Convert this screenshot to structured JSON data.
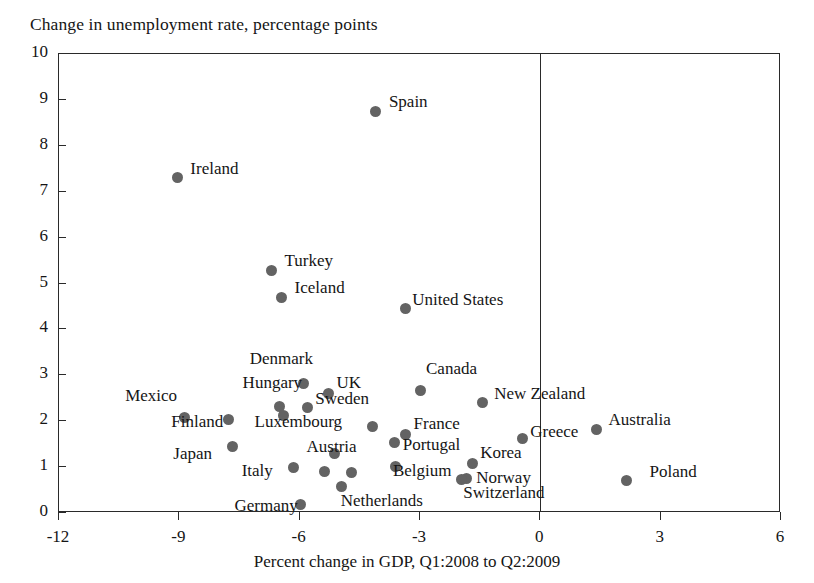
{
  "chart_data": {
    "type": "scatter",
    "title": "Change in unemployment rate, percentage points",
    "xlabel": "Percent change in GDP, Q1:2008 to Q2:2009",
    "ylabel": "Change in unemployment rate, percentage points",
    "xlim": [
      -12,
      6
    ],
    "ylim": [
      0,
      10
    ],
    "xticks": [
      -12,
      -9,
      -6,
      -3,
      0,
      3,
      6
    ],
    "yticks": [
      0,
      1,
      2,
      3,
      4,
      5,
      6,
      7,
      8,
      9,
      10
    ],
    "grid": false,
    "legend": "none",
    "marker_color": "#636363",
    "axis_color": "#2a2a2a",
    "annotations": [
      "Vertical reference line drawn at x = 0"
    ],
    "points": [
      {
        "label": "Spain",
        "x": -4.1,
        "y": 8.75,
        "lx": 14,
        "ly": -9
      },
      {
        "label": "Ireland",
        "x": -9.05,
        "y": 7.3,
        "lx": 14,
        "ly": -9
      },
      {
        "label": "Turkey",
        "x": -6.7,
        "y": 5.29,
        "lx": 14,
        "ly": -9
      },
      {
        "label": "Iceland",
        "x": -6.45,
        "y": 4.7,
        "lx": 14,
        "ly": -9
      },
      {
        "label": "United States",
        "x": -3.37,
        "y": 4.45,
        "lx": 8,
        "ly": -9
      },
      {
        "label": "Denmark",
        "x": -5.9,
        "y": 2.83,
        "lx": -53,
        "ly": -24
      },
      {
        "label": "UK",
        "x": -5.28,
        "y": 2.61,
        "lx": 9,
        "ly": -10
      },
      {
        "label": "Canada",
        "x": -3.0,
        "y": 2.66,
        "lx": 7,
        "ly": -22
      },
      {
        "label": "Sweden",
        "x": -5.81,
        "y": 2.29,
        "lx": 9,
        "ly": -9
      },
      {
        "label": "New Zealand",
        "x": -1.45,
        "y": 2.4,
        "lx": 13,
        "ly": -9
      },
      {
        "label": "Hungary",
        "x": -6.5,
        "y": 2.33,
        "lx": -36,
        "ly": -23
      },
      {
        "label": "Mexico",
        "x": -8.88,
        "y": 2.07,
        "lx": -58,
        "ly": -22
      },
      {
        "label": "Luxembourg",
        "x": -6.4,
        "y": 2.12,
        "lx": -28,
        "ly": 6
      },
      {
        "label": "Australia",
        "x": 1.4,
        "y": 1.82,
        "lx": 13,
        "ly": -9
      },
      {
        "label": "Finland",
        "x": -7.78,
        "y": 2.04,
        "lx": -56,
        "ly": 3
      },
      {
        "label": "Poland ",
        "x": -4.18,
        "y": 1.89,
        "lx": 0,
        "ly": 0,
        "hide_label": true
      },
      {
        "label": "France",
        "x": -3.36,
        "y": 1.72,
        "lx": 9,
        "ly": -10
      },
      {
        "label": "Portugal",
        "x": -3.63,
        "y": 1.54,
        "lx": 9,
        "ly": 3
      },
      {
        "label": "Greece",
        "x": -0.45,
        "y": 1.63,
        "lx": 9,
        "ly": -6
      },
      {
        "label": "Japan",
        "x": -7.68,
        "y": 1.44,
        "lx": -58,
        "ly": 7
      },
      {
        "label": "Korea",
        "x": -1.7,
        "y": 1.08,
        "lx": 9,
        "ly": -10
      },
      {
        "label": "Austria",
        "x": -5.38,
        "y": 0.9,
        "lx": -17,
        "ly": -25
      },
      {
        "label": "Italy",
        "x": -6.15,
        "y": 0.99,
        "lx": -51,
        "ly": 3
      },
      {
        "label": "Belgium",
        "x": -3.6,
        "y": 1.02,
        "lx": -2,
        "ly": 5
      },
      {
        "label": "Norway",
        "x": -1.85,
        "y": 0.76,
        "lx": 11,
        "ly": 0
      },
      {
        "label": "Switzerland",
        "x": -1.97,
        "y": 0.73,
        "lx": 3,
        "ly": 14
      },
      {
        "label": "Netherlands",
        "x": -4.95,
        "y": 0.58,
        "lx": 0,
        "ly": 15
      },
      {
        "label": "Germany",
        "x": -5.98,
        "y": 0.19,
        "lx": -65,
        "ly": 2
      },
      {
        "label": "Poland",
        "x": 2.15,
        "y": 0.7,
        "lx": 24,
        "ly": -9
      },
      {
        "label": "Austria2",
        "x": -4.72,
        "y": 0.89,
        "lx": 0,
        "ly": 0,
        "hide_label": true
      },
      {
        "label": "Italy2",
        "x": -5.12,
        "y": 1.3,
        "lx": 0,
        "ly": 0,
        "hide_label": true
      }
    ]
  },
  "axes": {
    "x_tick_labels": [
      "-12",
      "-9",
      "-6",
      "-3",
      "0",
      "3",
      "6"
    ],
    "y_tick_labels": [
      "0",
      "1",
      "2",
      "3",
      "4",
      "5",
      "6",
      "7",
      "8",
      "9",
      "10"
    ]
  }
}
